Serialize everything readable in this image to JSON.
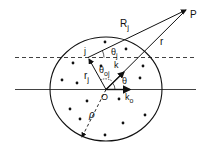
{
  "diagram": {
    "labels": {
      "P": "P",
      "Rj": "R",
      "Rj_sub": "j",
      "r": "r",
      "j": "j",
      "theta_j": "θ",
      "theta_j_sub": "j",
      "k": "k",
      "r_j": "r",
      "r_j_sub": "j",
      "theta_oj": "θ",
      "theta_oj_sub": "oj",
      "theta": "θ",
      "O": "O",
      "k_o": "k",
      "k_o_sub": "o",
      "rho": "ρ"
    },
    "colors": {
      "ink": "#111111",
      "background": "#ffffff"
    },
    "scatterer_count": 15
  }
}
